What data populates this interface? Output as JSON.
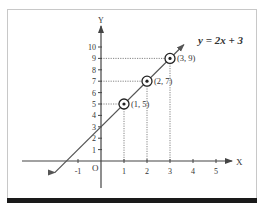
{
  "chart_data": {
    "type": "line",
    "title": "",
    "equation_label": "y = 2x + 3",
    "xlabel": "X",
    "ylabel": "Y",
    "origin_label": "O",
    "x_ticks": [
      -1,
      1,
      2,
      3,
      4,
      5
    ],
    "y_ticks": [
      1,
      2,
      3,
      4,
      5,
      6,
      7,
      8,
      9,
      10
    ],
    "xlim": [
      -2.5,
      5.8
    ],
    "ylim": [
      -2,
      11
    ],
    "grid": false,
    "series": [
      {
        "name": "y = 2x + 3",
        "slope": 2,
        "intercept": 3,
        "x": [
          -2,
          3.6
        ],
        "y": [
          -1,
          10.2
        ]
      }
    ],
    "points": [
      {
        "x": 1,
        "y": 5,
        "label": "(1, 5)"
      },
      {
        "x": 2,
        "y": 7,
        "label": "(2, 7)"
      },
      {
        "x": 3,
        "y": 9,
        "label": "(3, 9)"
      }
    ]
  },
  "colors": {
    "axis": "#444444",
    "line": "#555555",
    "guide": "#666666",
    "text": "#222222"
  }
}
